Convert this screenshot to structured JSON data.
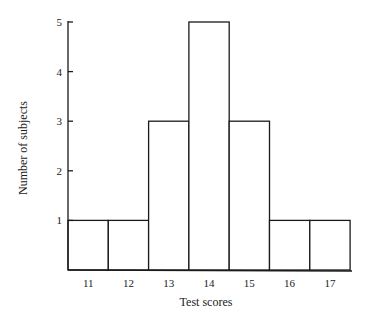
{
  "chart_data": {
    "type": "bar",
    "subtype": "histogram",
    "title": "",
    "xlabel": "Test scores",
    "ylabel": "Number of subjects",
    "categories": [
      "11",
      "12",
      "13",
      "14",
      "15",
      "16",
      "17"
    ],
    "values": [
      1,
      1,
      3,
      5,
      3,
      1,
      1
    ],
    "yticks": [
      1,
      2,
      3,
      4,
      5
    ],
    "ylim": [
      0,
      5
    ],
    "grid": false,
    "legend": null,
    "colors": {
      "bar_fill": "#ffffff",
      "bar_stroke": "#1a1a1a"
    }
  }
}
